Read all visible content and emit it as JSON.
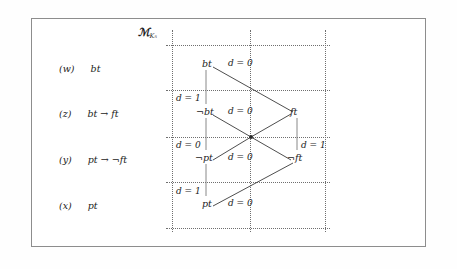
{
  "figure": {
    "model_label": {
      "symbol": "ℳ",
      "subscript": "K₅"
    },
    "rows": [
      {
        "tag": "(w)",
        "formula": "bt"
      },
      {
        "tag": "(z)",
        "formula": "bt → ft"
      },
      {
        "tag": "(y)",
        "formula": "pt → ¬ft"
      },
      {
        "tag": "(x)",
        "formula": "pt"
      }
    ],
    "atoms": [
      {
        "name": "atom-bt",
        "text": "bt"
      },
      {
        "name": "atom-not-bt",
        "text": "¬bt"
      },
      {
        "name": "atom-ft",
        "text": "ft"
      },
      {
        "name": "atom-not-pt",
        "text": "¬pt"
      },
      {
        "name": "atom-not-ft",
        "text": "¬ft"
      },
      {
        "name": "atom-pt",
        "text": "pt"
      }
    ],
    "degree_labels": [
      {
        "name": "degree-w-right",
        "text": "d = 0"
      },
      {
        "name": "degree-z-left",
        "text": "d = 1"
      },
      {
        "name": "degree-z-mid",
        "text": "d = 0"
      },
      {
        "name": "degree-y-left",
        "text": "d = 0"
      },
      {
        "name": "degree-y-mid",
        "text": "d = 0"
      },
      {
        "name": "degree-y-right",
        "text": "d = 1"
      },
      {
        "name": "degree-x-left",
        "text": "d = 1"
      },
      {
        "name": "degree-x-mid",
        "text": "d = 0"
      }
    ],
    "colors": {
      "frame": "#8d8d8d",
      "grid": "#6f6f6f",
      "edge": "#3a3a3a",
      "text": "#1b1b1b",
      "background": "#ffffff"
    }
  }
}
